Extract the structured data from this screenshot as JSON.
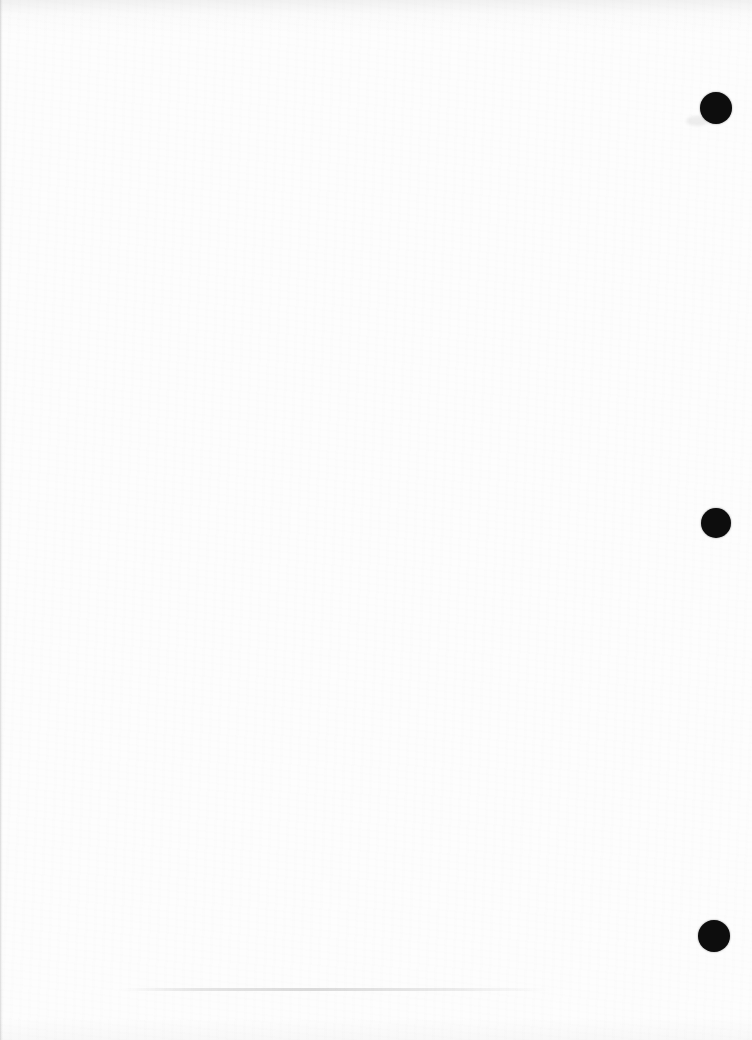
{
  "page": {
    "background_color": "#fdfdfd",
    "hole_color": "#0d0d0d"
  },
  "punch_holes": [
    {
      "cx": 716,
      "cy": 108,
      "r": 16
    },
    {
      "cx": 716,
      "cy": 523,
      "r": 15
    },
    {
      "cx": 714,
      "cy": 936,
      "r": 16
    }
  ]
}
